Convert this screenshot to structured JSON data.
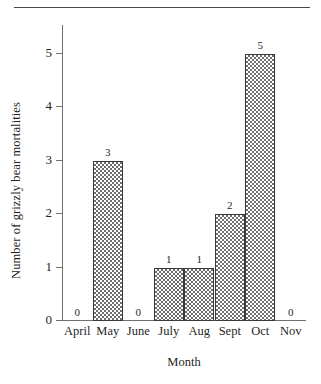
{
  "figure": {
    "top_rule": true,
    "background_color": "#ffffff",
    "bar_fill_color": "#6e6e6e",
    "bar_outline_color": "#3a3a3a",
    "axis_color": "#707070",
    "text_color": "#1f1f1f"
  },
  "chart_data": {
    "type": "bar",
    "title": "",
    "xlabel": "Month",
    "ylabel": "Number of grizzly bear mortalities",
    "categories": [
      "April",
      "May",
      "June",
      "July",
      "Aug",
      "Sept",
      "Oct",
      "Nov"
    ],
    "values": [
      0,
      3,
      0,
      1,
      1,
      2,
      5,
      0
    ],
    "data_labels": [
      "0",
      "3",
      "0",
      "1",
      "1",
      "2",
      "5",
      "0"
    ],
    "ylim": [
      0,
      5
    ],
    "yticks": [
      0,
      1,
      2,
      3,
      4,
      5
    ],
    "ytick_labels": [
      "0",
      "1",
      "2",
      "3",
      "4",
      "5"
    ],
    "grid": false,
    "legend": null,
    "bar_pattern": "checkerboard"
  }
}
